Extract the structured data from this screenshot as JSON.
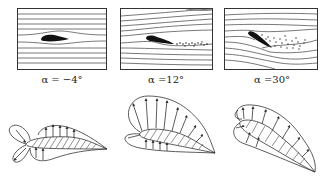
{
  "figure": {
    "panels": [
      {
        "id": "panel-1",
        "angle_label": "α = −4°",
        "angle_deg": -4,
        "flow": "attached streamlines"
      },
      {
        "id": "panel-2",
        "angle_label": "α =12°",
        "angle_deg": 12,
        "flow": "small trailing-edge separation wake"
      },
      {
        "id": "panel-3",
        "angle_label": "α =30°",
        "angle_deg": 30,
        "flow": "large separated wake (stall)"
      }
    ],
    "pressure_diagrams": [
      {
        "id": "pressure-1",
        "angle_deg": -4
      },
      {
        "id": "pressure-2",
        "angle_deg": 12
      },
      {
        "id": "pressure-3",
        "angle_deg": 30
      }
    ],
    "colors": {
      "line": "#333333",
      "airfoil_fill": "#111111",
      "background": "#ffffff"
    }
  }
}
